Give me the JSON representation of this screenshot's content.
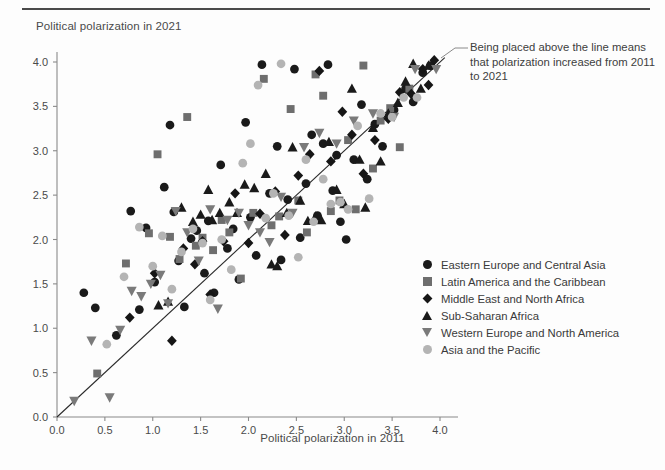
{
  "figure": {
    "y_axis_title": "Political polarization in 2021",
    "x_axis_title": "Political polarization in 2011",
    "annotation": "Being placed above the line means that polarization increased from 2011 to 2021"
  },
  "legend": {
    "items": [
      {
        "label": "Eastern Europe and Central Asia",
        "marker": "circle",
        "color": "#1a1a1a"
      },
      {
        "label": "Latin America and the Caribbean",
        "marker": "square",
        "color": "#6e6e6e"
      },
      {
        "label": "Middle East and North Africa",
        "marker": "diamond",
        "color": "#161616"
      },
      {
        "label": "Sub-Saharan Africa",
        "marker": "triangle-up",
        "color": "#1a1a1a"
      },
      {
        "label": "Western Europe and North America",
        "marker": "triangle-down",
        "color": "#7a7a7a"
      },
      {
        "label": "Asia and the Pacific",
        "marker": "circle",
        "color": "#b4b4b4"
      }
    ]
  },
  "chart_data": {
    "type": "scatter",
    "title": "",
    "xlabel": "Political polarization in 2011",
    "ylabel": "Political polarization in 2021",
    "xlim": [
      0.0,
      4.15
    ],
    "ylim": [
      0.0,
      4.15
    ],
    "xticks": [
      "0.0",
      "0.5",
      "1.0",
      "1.5",
      "2.0",
      "2.5",
      "3.0",
      "3.5",
      "4.0"
    ],
    "yticks": [
      "0.0",
      "0.5",
      "1.0",
      "1.5",
      "2.0",
      "2.5",
      "3.0",
      "3.5",
      "4.0"
    ],
    "xtick_values": [
      0.0,
      0.5,
      1.0,
      1.5,
      2.0,
      2.5,
      3.0,
      3.5,
      4.0
    ],
    "ytick_values": [
      0.0,
      0.5,
      1.0,
      1.5,
      2.0,
      2.5,
      3.0,
      3.5,
      4.0
    ],
    "grid": false,
    "legend_position": "right",
    "reference_line": {
      "type": "identity",
      "from": [
        0.0,
        0.0
      ],
      "to": [
        4.05,
        4.05
      ],
      "label": "y = x"
    },
    "annotation": "Being placed above the line means that polarization increased from 2011 to 2021",
    "series": [
      {
        "name": "Eastern Europe and Central Asia",
        "marker": "circle",
        "color": "#1a1a1a",
        "points": [
          [
            0.28,
            1.4
          ],
          [
            0.4,
            1.23
          ],
          [
            0.62,
            0.92
          ],
          [
            0.77,
            2.32
          ],
          [
            0.86,
            1.21
          ],
          [
            0.93,
            2.13
          ],
          [
            1.02,
            1.52
          ],
          [
            1.12,
            2.59
          ],
          [
            1.18,
            3.29
          ],
          [
            1.22,
            2.31
          ],
          [
            1.27,
            1.76
          ],
          [
            1.33,
            1.24
          ],
          [
            1.4,
            2.01
          ],
          [
            1.46,
            2.1
          ],
          [
            1.54,
            1.62
          ],
          [
            1.58,
            2.21
          ],
          [
            1.64,
            1.4
          ],
          [
            1.71,
            2.84
          ],
          [
            1.78,
            1.9
          ],
          [
            1.84,
            2.12
          ],
          [
            1.9,
            1.55
          ],
          [
            1.97,
            3.32
          ],
          [
            2.02,
            2.25
          ],
          [
            2.08,
            1.82
          ],
          [
            2.14,
            3.97
          ],
          [
            2.22,
            2.52
          ],
          [
            2.3,
            3.05
          ],
          [
            2.34,
            1.77
          ],
          [
            2.41,
            2.45
          ],
          [
            2.48,
            3.92
          ],
          [
            2.54,
            2.02
          ],
          [
            2.6,
            2.63
          ],
          [
            2.66,
            3.18
          ],
          [
            2.72,
            2.27
          ],
          [
            2.78,
            3.08
          ],
          [
            2.83,
            3.97
          ],
          [
            2.88,
            2.55
          ],
          [
            2.92,
            2.95
          ],
          [
            2.96,
            2.2
          ],
          [
            3.02,
            2.0
          ],
          [
            3.1,
            2.9
          ],
          [
            3.18,
            3.52
          ],
          [
            3.24,
            2.68
          ],
          [
            3.32,
            3.3
          ],
          [
            3.4,
            3.05
          ],
          [
            3.52,
            3.46
          ],
          [
            3.64,
            3.7
          ],
          [
            3.72,
            3.55
          ],
          [
            3.82,
            3.88
          ],
          [
            3.9,
            3.96
          ]
        ]
      },
      {
        "name": "Latin America and the Caribbean",
        "marker": "square",
        "color": "#6e6e6e",
        "points": [
          [
            0.42,
            0.49
          ],
          [
            0.72,
            1.73
          ],
          [
            0.96,
            2.07
          ],
          [
            1.05,
            2.96
          ],
          [
            1.18,
            2.03
          ],
          [
            1.28,
            1.78
          ],
          [
            1.36,
            3.38
          ],
          [
            1.45,
            1.93
          ],
          [
            1.52,
            2.02
          ],
          [
            1.63,
            1.88
          ],
          [
            1.72,
            2.22
          ],
          [
            1.8,
            2.08
          ],
          [
            1.92,
            1.56
          ],
          [
            2.05,
            2.3
          ],
          [
            2.16,
            3.81
          ],
          [
            2.24,
            2.16
          ],
          [
            2.32,
            2.26
          ],
          [
            2.44,
            3.47
          ],
          [
            2.52,
            2.44
          ],
          [
            2.61,
            2.08
          ],
          [
            2.7,
            3.86
          ],
          [
            2.78,
            3.62
          ],
          [
            2.86,
            2.32
          ],
          [
            2.95,
            2.44
          ],
          [
            3.04,
            3.12
          ],
          [
            3.12,
            2.34
          ],
          [
            3.2,
            3.96
          ],
          [
            3.3,
            2.8
          ],
          [
            3.38,
            3.34
          ],
          [
            3.48,
            3.48
          ],
          [
            3.58,
            3.04
          ],
          [
            3.68,
            3.7
          ]
        ]
      },
      {
        "name": "Middle East and North Africa",
        "marker": "diamond",
        "color": "#161616",
        "points": [
          [
            0.76,
            1.12
          ],
          [
            1.02,
            1.62
          ],
          [
            1.2,
            0.86
          ],
          [
            1.32,
            1.9
          ],
          [
            1.44,
            1.72
          ],
          [
            1.52,
            1.98
          ],
          [
            1.6,
            1.38
          ],
          [
            1.74,
            1.98
          ],
          [
            1.86,
            2.52
          ],
          [
            2.0,
            1.96
          ],
          [
            2.12,
            2.29
          ],
          [
            2.28,
            2.54
          ],
          [
            2.38,
            2.05
          ],
          [
            2.52,
            2.72
          ],
          [
            2.64,
            2.96
          ],
          [
            2.74,
            3.9
          ],
          [
            2.86,
            2.88
          ],
          [
            2.98,
            3.44
          ],
          [
            3.08,
            3.18
          ],
          [
            3.2,
            2.74
          ],
          [
            3.32,
            3.12
          ],
          [
            3.46,
            3.36
          ],
          [
            3.58,
            3.66
          ],
          [
            3.7,
            3.64
          ],
          [
            3.82,
            3.92
          ],
          [
            3.88,
            3.74
          ],
          [
            3.94,
            4.02
          ]
        ]
      },
      {
        "name": "Sub-Saharan Africa",
        "marker": "triangle-up",
        "color": "#1a1a1a",
        "points": [
          [
            1.06,
            1.26
          ],
          [
            1.16,
            1.3
          ],
          [
            1.3,
            2.36
          ],
          [
            1.42,
            2.2
          ],
          [
            1.5,
            2.28
          ],
          [
            1.58,
            2.56
          ],
          [
            1.62,
            2.22
          ],
          [
            1.7,
            2.3
          ],
          [
            1.8,
            2.42
          ],
          [
            1.88,
            2.3
          ],
          [
            1.96,
            2.62
          ],
          [
            2.06,
            2.58
          ],
          [
            2.18,
            2.74
          ],
          [
            2.24,
            1.72
          ],
          [
            2.3,
            1.7
          ],
          [
            2.4,
            2.3
          ],
          [
            2.46,
            3.04
          ],
          [
            2.54,
            2.44
          ],
          [
            2.62,
            2.21
          ],
          [
            2.7,
            2.26
          ],
          [
            2.76,
            2.22
          ],
          [
            2.84,
            3.1
          ],
          [
            2.92,
            2.56
          ],
          [
            3.0,
            2.4
          ],
          [
            3.08,
            3.7
          ],
          [
            3.16,
            2.9
          ],
          [
            3.22,
            2.36
          ],
          [
            3.3,
            3.26
          ],
          [
            3.38,
            2.88
          ],
          [
            3.46,
            3.42
          ],
          [
            3.56,
            3.54
          ],
          [
            3.64,
            3.78
          ],
          [
            3.72,
            3.98
          ],
          [
            3.8,
            3.7
          ],
          [
            3.88,
            3.96
          ]
        ]
      },
      {
        "name": "Western Europe and North America",
        "marker": "triangle-down",
        "color": "#7a7a7a",
        "points": [
          [
            0.18,
            0.18
          ],
          [
            0.36,
            0.86
          ],
          [
            0.55,
            0.22
          ],
          [
            0.66,
            0.98
          ],
          [
            0.78,
            1.42
          ],
          [
            0.88,
            1.36
          ],
          [
            0.98,
            1.5
          ],
          [
            1.08,
            1.6
          ],
          [
            1.16,
            1.28
          ],
          [
            1.24,
            2.32
          ],
          [
            1.36,
            2.08
          ],
          [
            1.48,
            1.76
          ],
          [
            1.6,
            2.34
          ],
          [
            1.68,
            1.22
          ],
          [
            1.78,
            2.22
          ],
          [
            1.9,
            2.3
          ],
          [
            2.0,
            2.16
          ],
          [
            2.12,
            2.08
          ],
          [
            2.22,
            1.97
          ],
          [
            2.34,
            2.48
          ],
          [
            2.46,
            2.3
          ],
          [
            2.58,
            3.04
          ],
          [
            2.74,
            3.2
          ],
          [
            2.92,
            3.08
          ],
          [
            3.1,
            3.34
          ],
          [
            3.3,
            3.42
          ],
          [
            3.52,
            3.38
          ],
          [
            3.74,
            3.92
          ],
          [
            3.96,
            3.92
          ]
        ]
      },
      {
        "name": "Asia and the Pacific",
        "marker": "circle",
        "color": "#b4b4b4",
        "points": [
          [
            0.52,
            0.82
          ],
          [
            0.7,
            1.58
          ],
          [
            0.86,
            2.14
          ],
          [
            1.0,
            1.7
          ],
          [
            1.1,
            2.04
          ],
          [
            1.2,
            1.44
          ],
          [
            1.3,
            1.86
          ],
          [
            1.42,
            2.12
          ],
          [
            1.52,
            1.96
          ],
          [
            1.6,
            1.32
          ],
          [
            1.72,
            2.0
          ],
          [
            1.82,
            1.66
          ],
          [
            1.94,
            2.86
          ],
          [
            2.02,
            3.08
          ],
          [
            2.1,
            3.74
          ],
          [
            2.18,
            2.24
          ],
          [
            2.26,
            2.52
          ],
          [
            2.34,
            3.98
          ],
          [
            2.42,
            2.27
          ],
          [
            2.52,
            1.8
          ],
          [
            2.6,
            2.9
          ],
          [
            2.68,
            2.2
          ],
          [
            2.78,
            2.68
          ],
          [
            2.86,
            2.4
          ],
          [
            2.96,
            2.42
          ],
          [
            3.04,
            2.34
          ],
          [
            3.14,
            3.28
          ],
          [
            3.26,
            2.46
          ],
          [
            3.38,
            3.42
          ],
          [
            3.5,
            3.38
          ],
          [
            3.62,
            3.6
          ],
          [
            3.76,
            3.6
          ]
        ]
      }
    ]
  }
}
